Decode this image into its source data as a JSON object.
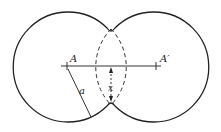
{
  "diagram": {
    "labels": {
      "left_center": "A",
      "right_center": "A′",
      "radius": "a",
      "distance": "x"
    },
    "colors": {
      "stroke": "#222222",
      "background": "#ffffff"
    }
  }
}
